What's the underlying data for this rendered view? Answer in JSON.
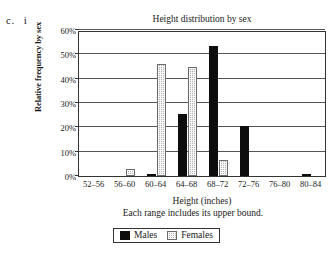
{
  "part_marker": {
    "letter": "c.",
    "roman": "i"
  },
  "chart_data": {
    "type": "bar",
    "title": "Height distribution by sex",
    "xlabel": "Height (inches)",
    "ylabel": "Relative frequency by sex",
    "note": "Each range includes its upper bound.",
    "categories": [
      "52–56",
      "56–60",
      "60–64",
      "64–68",
      "68–72",
      "72–76",
      "76–80",
      "80–84"
    ],
    "series": [
      {
        "name": "Males",
        "color": "#0d0d0d",
        "values": [
          0,
          0,
          1,
          25.5,
          53.5,
          20.5,
          0,
          1
        ]
      },
      {
        "name": "Females",
        "color": "#b3b3b3",
        "values": [
          0,
          3,
          46,
          45,
          6.5,
          0,
          0,
          0
        ]
      }
    ],
    "ylim": [
      0,
      60
    ],
    "ytick_values": [
      0,
      10,
      20,
      30,
      40,
      50,
      60
    ],
    "ytick_labels": [
      "0%",
      "10%",
      "20%",
      "30%",
      "40%",
      "50%",
      "60%"
    ],
    "grid": true,
    "legend_position": "bottom"
  }
}
